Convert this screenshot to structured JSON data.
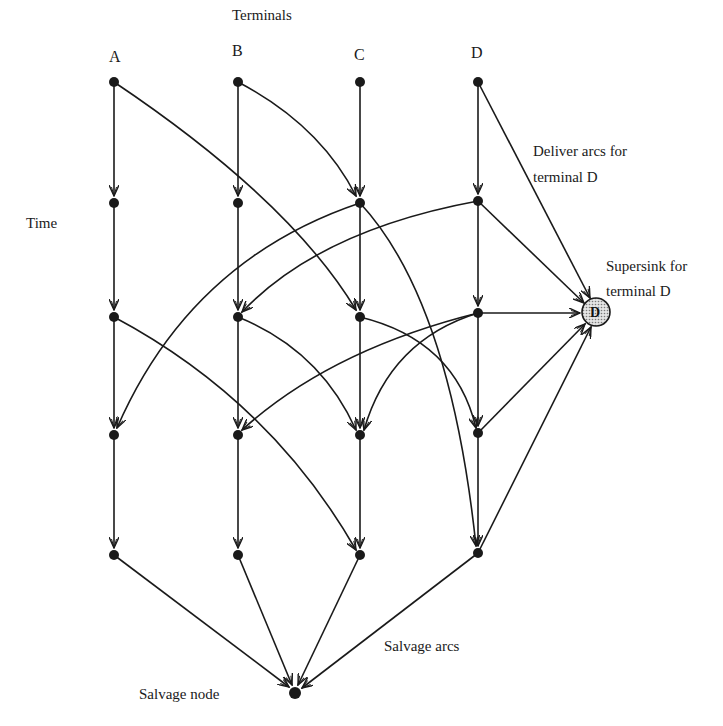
{
  "title": "Terminals",
  "terminals": [
    "A",
    "B",
    "C",
    "D"
  ],
  "labels": {
    "time": "Time",
    "deliver_line1": "Deliver arcs for",
    "deliver_line2": "terminal D",
    "supersink_line1": "Supersink for",
    "supersink_line2": "terminal D",
    "supersink_node": "D",
    "salvage_arcs": "Salvage arcs",
    "salvage_node": "Salvage node"
  },
  "columns_x": [
    114,
    238,
    360,
    478
  ],
  "rows_y": [
    82,
    203,
    317,
    435,
    555
  ],
  "supersink": {
    "x": 596,
    "y": 312,
    "r": 14
  },
  "salvage": {
    "x": 295,
    "y": 693
  },
  "colors": {
    "ink": "#1a1a1a",
    "background": "#ffffff",
    "supersink_fill": "#c8c8c8"
  }
}
